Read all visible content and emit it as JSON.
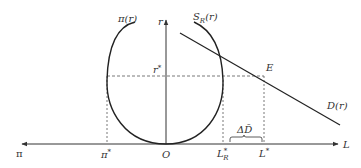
{
  "diagram": {
    "colors": {
      "ink": "#333333",
      "dash": "#555555"
    },
    "axes": {
      "horizontal_left_label": "π",
      "horizontal_right_label": "L",
      "vertical_label": "r",
      "origin_label": "O"
    },
    "curves": {
      "pi_label_main": "π",
      "pi_label_arg": "(r)",
      "s_label_main": "S",
      "s_label_sub": "R",
      "s_label_arg": "(r)",
      "d_label": "D(r)"
    },
    "markers": {
      "r_star_main": "r",
      "r_star_sup": "*",
      "pi_star_main": "π",
      "pi_star_sup": "*",
      "l_r_star_main": "L",
      "l_r_star_sup": "*",
      "l_r_star_sub": "R",
      "l_star_main": "L",
      "l_star_sup": "*",
      "equilibrium_label": "E",
      "delta_d_label": "ΔD̄"
    }
  }
}
